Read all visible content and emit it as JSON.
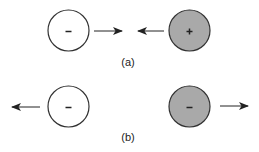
{
  "colors": {
    "stroke": "#333333",
    "particle_light_fill": "#ffffff",
    "particle_dark_fill": "#a9a9a9",
    "text": "#222222"
  },
  "panels": [
    {
      "label": "(a)",
      "description": "opposite charges attract",
      "left_particle": {
        "sign": "-",
        "fill": "light",
        "cx": 68.5,
        "cy": 30.5,
        "r": 20.5
      },
      "right_particle": {
        "sign": "+",
        "fill": "dark",
        "cx": 189.5,
        "cy": 30.5,
        "r": 20.5
      },
      "arrows": [
        {
          "direction": "right",
          "x1": 94,
          "x2": 122,
          "y": 31
        },
        {
          "direction": "left",
          "x1": 164,
          "x2": 138,
          "y": 31
        }
      ]
    },
    {
      "label": "(b)",
      "description": "like charges repel",
      "left_particle": {
        "sign": "-",
        "fill": "light",
        "cx": 68.5,
        "cy": 106.5,
        "r": 20.5
      },
      "right_particle": {
        "sign": "-",
        "fill": "dark",
        "cx": 189.5,
        "cy": 106.5,
        "r": 20.5
      },
      "arrows": [
        {
          "direction": "left",
          "x1": 40,
          "x2": 12,
          "y": 107
        },
        {
          "direction": "right",
          "x1": 220,
          "x2": 248,
          "y": 106
        }
      ]
    }
  ]
}
